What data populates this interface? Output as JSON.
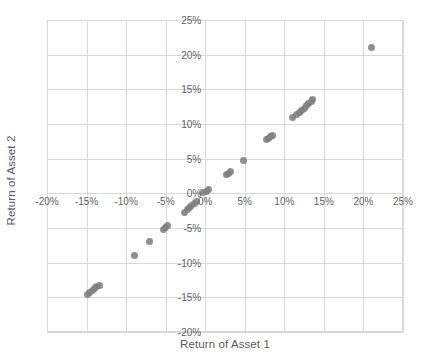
{
  "chart_data": {
    "type": "scatter",
    "title": "",
    "xlabel": "Return of Asset 1",
    "ylabel": "Return of Asset 2",
    "xlim": [
      -20,
      25
    ],
    "ylim": [
      -20,
      25
    ],
    "xtick_values": [
      -20,
      -15,
      -10,
      -5,
      0,
      5,
      10,
      15,
      20,
      25
    ],
    "ytick_values": [
      -20,
      -15,
      -10,
      -5,
      0,
      5,
      10,
      15,
      20,
      25
    ],
    "xtick_labels": [
      "-20%",
      "-15%",
      "-10%",
      "-5%",
      "0%",
      "5%",
      "10%",
      "15%",
      "20%",
      "25%"
    ],
    "ytick_labels": [
      "-20%",
      "-15%",
      "-10%",
      "-5%",
      "0%",
      "5%",
      "10%",
      "15%",
      "20%",
      "25%"
    ],
    "grid": true,
    "legend": false,
    "legend_position": "none",
    "axis_labels_at_zero": true,
    "marker_color": "#808080",
    "marker_size": 7,
    "grid_color": "#d9d9d9",
    "series": [
      {
        "name": "Asset returns",
        "points": [
          [
            -14.9,
            -14.6
          ],
          [
            -14.6,
            -14.3
          ],
          [
            -14.3,
            -14.0
          ],
          [
            -14.0,
            -13.7
          ],
          [
            -13.7,
            -13.5
          ],
          [
            -13.4,
            -13.3
          ],
          [
            -9.0,
            -8.9
          ],
          [
            -7.0,
            -6.9
          ],
          [
            -5.3,
            -5.2
          ],
          [
            -5.0,
            -4.9
          ],
          [
            -4.8,
            -4.7
          ],
          [
            -2.6,
            -2.7
          ],
          [
            -2.3,
            -2.4
          ],
          [
            -2.0,
            -2.1
          ],
          [
            -1.7,
            -1.8
          ],
          [
            -1.4,
            -1.5
          ],
          [
            -1.1,
            -1.2
          ],
          [
            -0.3,
            0.1
          ],
          [
            0.1,
            0.3
          ],
          [
            0.4,
            0.5
          ],
          [
            2.7,
            2.7
          ],
          [
            3.0,
            2.9
          ],
          [
            3.2,
            3.1
          ],
          [
            4.8,
            4.8
          ],
          [
            7.7,
            7.7
          ],
          [
            8.0,
            7.9
          ],
          [
            8.2,
            8.2
          ],
          [
            8.5,
            8.4
          ],
          [
            11.0,
            11.0
          ],
          [
            11.5,
            11.3
          ],
          [
            11.9,
            11.7
          ],
          [
            12.2,
            12.0
          ],
          [
            12.5,
            12.3
          ],
          [
            12.8,
            12.6
          ],
          [
            13.1,
            12.9
          ],
          [
            13.4,
            13.2
          ],
          [
            13.6,
            13.5
          ],
          [
            21.0,
            21.0
          ]
        ]
      }
    ]
  }
}
